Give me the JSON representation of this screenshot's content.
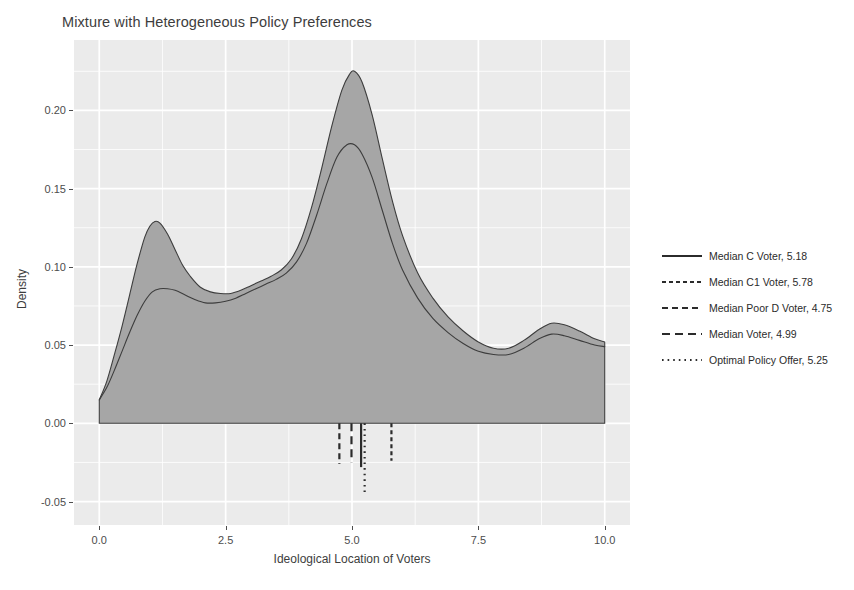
{
  "title": "Mixture with Heterogeneous Policy Preferences",
  "axes": {
    "x_title": "Ideological Location of Voters",
    "y_title": "Density",
    "x_ticks": [
      "0.0",
      "2.5",
      "5.0",
      "7.5",
      "10.0"
    ],
    "y_ticks": [
      "-0.05",
      "0.00",
      "0.05",
      "0.10",
      "0.15",
      "0.20"
    ]
  },
  "legend": {
    "items": [
      {
        "label": "Median C Voter, 5.18",
        "style": "solid",
        "value": 5.18
      },
      {
        "label": "Median C1 Voter, 5.78",
        "style": "dashed-short",
        "value": 5.78
      },
      {
        "label": "Median Poor D Voter, 4.75",
        "style": "dashed-medium",
        "value": 4.75
      },
      {
        "label": "Median Voter, 4.99",
        "style": "dashed-long",
        "value": 4.99
      },
      {
        "label": "Optimal Policy Offer, 5.25",
        "style": "dotted",
        "value": 5.25
      }
    ]
  },
  "colors": {
    "panel_background": "#ebebeb",
    "gridline_major": "#ffffff",
    "gridline_minor": "#ffffff",
    "density_fill": "#a6a6a6",
    "density_line": "#3d3d3d",
    "text": "#4d4d4d",
    "rule_line": "#2b2b2b"
  },
  "chart_data": {
    "type": "area",
    "title": "Mixture with Heterogeneous Policy Preferences",
    "xlabel": "Ideological Location of Voters",
    "ylabel": "Density",
    "xlim": [
      -0.5,
      10.5
    ],
    "ylim": [
      -0.065,
      0.245
    ],
    "grid": true,
    "legend_position": "right",
    "x_ticks": [
      0.0,
      2.5,
      5.0,
      7.5,
      10.0
    ],
    "y_ticks": [
      -0.05,
      0.0,
      0.05,
      0.1,
      0.15,
      0.2
    ],
    "series": [
      {
        "name": "Outer density (filled)",
        "filled": true,
        "x": [
          0.0,
          0.15,
          0.3,
          0.45,
          0.6,
          0.75,
          0.9,
          1.0,
          1.1,
          1.2,
          1.35,
          1.5,
          1.65,
          1.8,
          2.0,
          2.2,
          2.4,
          2.6,
          2.8,
          3.0,
          3.2,
          3.4,
          3.6,
          3.8,
          4.0,
          4.2,
          4.4,
          4.6,
          4.8,
          4.95,
          5.05,
          5.2,
          5.4,
          5.6,
          5.8,
          6.0,
          6.3,
          6.6,
          6.9,
          7.2,
          7.5,
          7.8,
          8.1,
          8.4,
          8.7,
          8.95,
          9.2,
          9.5,
          9.8,
          10.0
        ],
        "y": [
          0.015,
          0.027,
          0.044,
          0.062,
          0.082,
          0.102,
          0.119,
          0.126,
          0.129,
          0.128,
          0.121,
          0.111,
          0.101,
          0.094,
          0.087,
          0.084,
          0.083,
          0.083,
          0.085,
          0.088,
          0.091,
          0.094,
          0.098,
          0.105,
          0.118,
          0.138,
          0.163,
          0.19,
          0.213,
          0.223,
          0.225,
          0.218,
          0.197,
          0.169,
          0.142,
          0.12,
          0.096,
          0.08,
          0.068,
          0.059,
          0.052,
          0.048,
          0.048,
          0.053,
          0.06,
          0.064,
          0.063,
          0.059,
          0.054,
          0.052
        ]
      },
      {
        "name": "Inner density (outline)",
        "filled": false,
        "x": [
          0.0,
          0.15,
          0.3,
          0.45,
          0.6,
          0.75,
          0.9,
          1.05,
          1.2,
          1.35,
          1.5,
          1.7,
          1.9,
          2.1,
          2.3,
          2.5,
          2.7,
          2.9,
          3.1,
          3.3,
          3.5,
          3.7,
          3.9,
          4.1,
          4.3,
          4.5,
          4.7,
          4.9,
          5.05,
          5.2,
          5.4,
          5.6,
          5.8,
          6.0,
          6.3,
          6.6,
          6.9,
          7.2,
          7.5,
          7.8,
          8.1,
          8.4,
          8.7,
          8.95,
          9.2,
          9.5,
          9.8,
          10.0
        ],
        "y": [
          0.015,
          0.023,
          0.034,
          0.046,
          0.058,
          0.069,
          0.078,
          0.084,
          0.086,
          0.086,
          0.085,
          0.082,
          0.079,
          0.077,
          0.077,
          0.078,
          0.08,
          0.083,
          0.086,
          0.089,
          0.092,
          0.096,
          0.103,
          0.115,
          0.133,
          0.153,
          0.17,
          0.178,
          0.178,
          0.172,
          0.157,
          0.136,
          0.115,
          0.098,
          0.08,
          0.067,
          0.058,
          0.051,
          0.046,
          0.044,
          0.044,
          0.048,
          0.054,
          0.057,
          0.056,
          0.053,
          0.05,
          0.049
        ]
      }
    ],
    "vertical_rules": [
      {
        "label": "Median C Voter, 5.18",
        "x": 5.18,
        "style": "solid",
        "y_top": 0.0,
        "y_bottom": -0.028
      },
      {
        "label": "Median C1 Voter, 5.78",
        "x": 5.78,
        "style": "dashed-short",
        "y_top": 0.0,
        "y_bottom": -0.024
      },
      {
        "label": "Median Poor D Voter, 4.75",
        "x": 4.75,
        "style": "dashed-medium",
        "y_top": 0.0,
        "y_bottom": -0.026
      },
      {
        "label": "Median Voter, 4.99",
        "x": 4.99,
        "style": "dashed-long",
        "y_top": 0.0,
        "y_bottom": -0.025
      },
      {
        "label": "Optimal Policy Offer, 5.25",
        "x": 5.25,
        "style": "dotted",
        "y_top": 0.0,
        "y_bottom": -0.044
      }
    ]
  }
}
